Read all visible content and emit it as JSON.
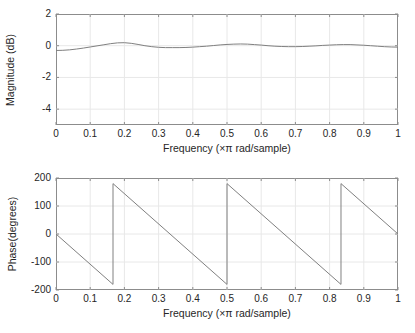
{
  "figure": {
    "background": "#ffffff",
    "line_color": "#808080",
    "axis_color": "#8c8c8c",
    "grid_color": "#e8e8e8",
    "text_color": "#262626"
  },
  "chart_data": [
    {
      "type": "line",
      "id": "magnitude-response",
      "title": "",
      "xlabel": "Frequency (×π rad/sample)",
      "ylabel": "Magnitude (dB)",
      "xlim": [
        0,
        1
      ],
      "ylim": [
        -5,
        2
      ],
      "xticks": [
        0,
        0.1,
        0.2,
        0.3,
        0.4,
        0.5,
        0.6,
        0.7,
        0.8,
        0.9,
        1
      ],
      "xtick_labels": [
        "0",
        "0.1",
        "0.2",
        "0.3",
        "0.4",
        "0.5",
        "0.6",
        "0.7",
        "0.8",
        "0.9",
        "1"
      ],
      "yticks": [
        2,
        0,
        -2,
        -4
      ],
      "ytick_labels": [
        "2",
        "0",
        "-2",
        "-4"
      ],
      "grid": true,
      "legend": "none",
      "x": [
        0,
        0.02,
        0.04,
        0.06,
        0.08,
        0.1,
        0.12,
        0.14,
        0.16,
        0.18,
        0.2,
        0.22,
        0.24,
        0.26,
        0.28,
        0.3,
        0.32,
        0.34,
        0.36,
        0.38,
        0.4,
        0.42,
        0.44,
        0.46,
        0.48,
        0.5,
        0.52,
        0.54,
        0.56,
        0.58,
        0.6,
        0.62,
        0.64,
        0.66,
        0.68,
        0.7,
        0.72,
        0.74,
        0.76,
        0.78,
        0.8,
        0.82,
        0.84,
        0.86,
        0.88,
        0.9,
        0.92,
        0.94,
        0.96,
        0.98,
        1
      ],
      "y": [
        -0.3,
        -0.29,
        -0.26,
        -0.21,
        -0.15,
        -0.08,
        -0.01,
        0.06,
        0.13,
        0.18,
        0.19,
        0.15,
        0.08,
        0.0,
        -0.06,
        -0.1,
        -0.12,
        -0.12,
        -0.12,
        -0.11,
        -0.09,
        -0.06,
        -0.03,
        0.01,
        0.05,
        0.08,
        0.1,
        0.11,
        0.1,
        0.07,
        0.04,
        0.0,
        -0.03,
        -0.05,
        -0.06,
        -0.06,
        -0.05,
        -0.03,
        -0.01,
        0.02,
        0.04,
        0.06,
        0.07,
        0.07,
        0.05,
        0.03,
        0.0,
        -0.03,
        -0.06,
        -0.08,
        -0.09
      ]
    },
    {
      "type": "line",
      "id": "phase-response",
      "title": "",
      "xlabel": "Frequency (×π rad/sample)",
      "ylabel": "Phase(degrees)",
      "xlim": [
        0,
        1
      ],
      "ylim": [
        -200,
        200
      ],
      "xticks": [
        0,
        0.1,
        0.2,
        0.3,
        0.4,
        0.5,
        0.6,
        0.7,
        0.8,
        0.9,
        1
      ],
      "xtick_labels": [
        "0",
        "0.1",
        "0.2",
        "0.3",
        "0.4",
        "0.5",
        "0.6",
        "0.7",
        "0.8",
        "0.9",
        "1"
      ],
      "yticks": [
        200,
        100,
        0,
        -100,
        -200
      ],
      "ytick_labels": [
        "200",
        "100",
        "0",
        "-100",
        "-200"
      ],
      "grid": true,
      "legend": "none",
      "description": "Wrapped linear phase, slope -1080 deg per unit x, wrapping at 0.1667, 0.5, 0.8333",
      "segments": [
        {
          "x": [
            0,
            0.1667
          ],
          "y": [
            0,
            -180
          ]
        },
        {
          "x": [
            0.1667,
            0.5
          ],
          "y": [
            180,
            -180
          ]
        },
        {
          "x": [
            0.5,
            0.8333
          ],
          "y": [
            180,
            -180
          ]
        },
        {
          "x": [
            0.8333,
            1
          ],
          "y": [
            180,
            0
          ]
        }
      ],
      "wrap_points": [
        0.1667,
        0.5,
        0.8333
      ]
    }
  ]
}
